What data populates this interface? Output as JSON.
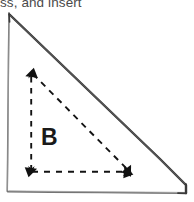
{
  "caption": {
    "text": "ss, and insert"
  },
  "figure": {
    "label_b": "B",
    "colors": {
      "background": "#ffffff",
      "caption_text": "#4a4a4a",
      "solid_outline_dark": "#2b2b2b",
      "solid_outline_light": "#6e6e6e",
      "dashed_stroke": "#111111",
      "label_text": "#1a1a1a"
    },
    "outer_triangle": {
      "style": "solid-sketch",
      "vertices": [
        {
          "name": "apex-top-left",
          "x": 9,
          "y": 14
        },
        {
          "name": "corner-bottom-left",
          "x": 7,
          "y": 192
        },
        {
          "name": "corner-bottom-right",
          "x": 186,
          "y": 193
        }
      ]
    },
    "inner_triangle": {
      "style": "dashed-with-arrowheads",
      "vertices": [
        {
          "name": "apex-top",
          "x": 31,
          "y": 71
        },
        {
          "name": "corner-bottom-left",
          "x": 31,
          "y": 172
        },
        {
          "name": "corner-bottom-right",
          "x": 131,
          "y": 172
        }
      ]
    }
  }
}
